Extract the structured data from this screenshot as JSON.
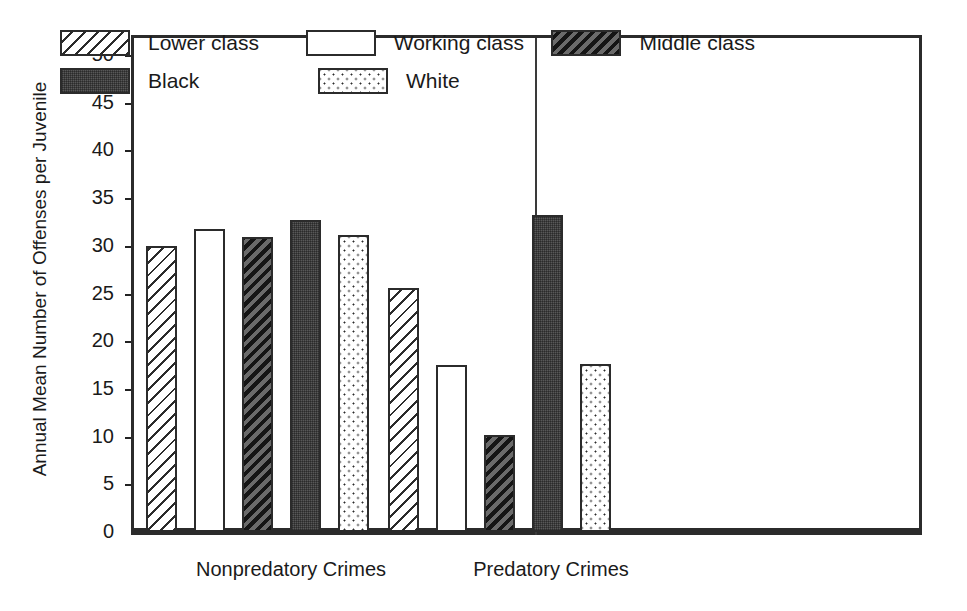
{
  "chart_data": {
    "type": "bar",
    "title": "",
    "subtitle": "",
    "xlabel": "",
    "ylabel": "Annual Mean Number of Offenses per Juvenile",
    "ylim": [
      0,
      50
    ],
    "ytick_step": 5,
    "yticks": [
      "50",
      "45",
      "40",
      "35",
      "30",
      "25",
      "20",
      "15",
      "10",
      "5",
      "0"
    ],
    "grid": false,
    "legend_position": "top-inside",
    "categories": [
      "Nonpredatory Crimes",
      "Predatory Crimes"
    ],
    "series": [
      {
        "name": "Lower class",
        "pattern": "diagonal-hatch",
        "values": [
          30.0,
          25.6
        ]
      },
      {
        "name": "Working class",
        "pattern": "open-white",
        "values": [
          31.8,
          17.5
        ]
      },
      {
        "name": "Middle class",
        "pattern": "dark-diagonal-hatch",
        "values": [
          30.9,
          10.2
        ]
      },
      {
        "name": "Black",
        "pattern": "solid-gray-stipple",
        "values": [
          32.7,
          33.2
        ]
      },
      {
        "name": "White",
        "pattern": "fine-dots",
        "values": [
          31.1,
          17.6
        ]
      }
    ]
  },
  "legend": {
    "rows": [
      [
        {
          "label": "Lower class",
          "pattern": "diagonal-hatch"
        },
        {
          "label": "Working class",
          "pattern": "open-white"
        },
        {
          "label": "Middle class",
          "pattern": "dark-diagonal-hatch"
        }
      ],
      [
        {
          "label": "Black",
          "pattern": "solid-gray-stipple"
        },
        {
          "label": "White",
          "pattern": "fine-dots"
        }
      ]
    ]
  },
  "colors": {
    "axis": "#2b2b2b",
    "ink": "#1a1a1a",
    "background": "#ffffff",
    "dark_fill": "#585858",
    "hatch_line": "#2b2b2b"
  }
}
